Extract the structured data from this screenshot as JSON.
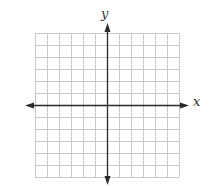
{
  "diagram": {
    "type": "coordinate-grid",
    "x_label": "x",
    "y_label": "y",
    "grid": {
      "cells_x": 12,
      "cells_y": 12,
      "left": 35,
      "top": 33,
      "cell": 12
    },
    "colors": {
      "grid": "#c8c8c8",
      "axis": "#2a2a2a",
      "background": "#ffffff"
    }
  }
}
